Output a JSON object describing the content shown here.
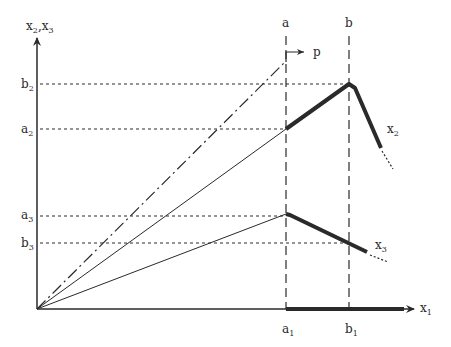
{
  "diagram": {
    "axes": {
      "y_label": "x",
      "y_label_sub1": "2",
      "y_label_sep": ",x",
      "y_label_sub2": "3",
      "x_label": "x",
      "x_label_sub": "1"
    },
    "verticals": {
      "a": "a",
      "b": "b"
    },
    "y_ticks": [
      {
        "base": "b",
        "sub": "2"
      },
      {
        "base": "a",
        "sub": "2"
      },
      {
        "base": "a",
        "sub": "3"
      },
      {
        "base": "b",
        "sub": "3"
      }
    ],
    "x_ticks": [
      {
        "base": "a",
        "sub": "1"
      },
      {
        "base": "b",
        "sub": "1"
      }
    ],
    "curves": {
      "x2": {
        "base": "x",
        "sub": "2"
      },
      "x3": {
        "base": "x",
        "sub": "3"
      }
    },
    "p_label": "p",
    "colors": {
      "ink": "#2a2a2a",
      "background": "#ffffff"
    }
  }
}
